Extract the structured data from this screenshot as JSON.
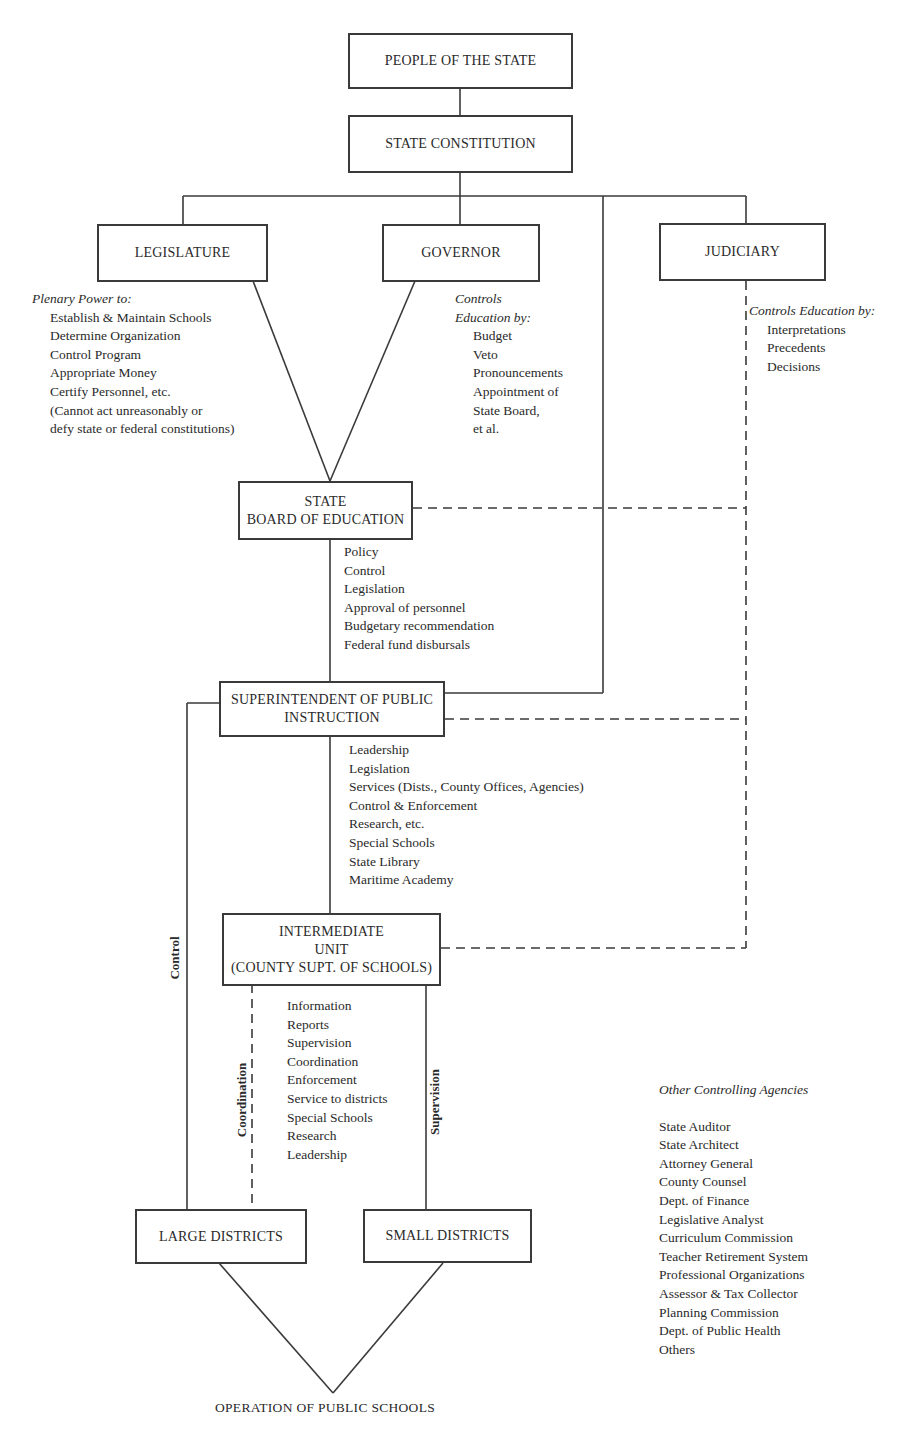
{
  "diagram": {
    "nodes": {
      "people": "PEOPLE OF THE STATE",
      "constitution": "STATE CONSTITUTION",
      "legislature": "LEGISLATURE",
      "governor": "GOVERNOR",
      "judiciary": "JUDICIARY",
      "state_board": [
        "STATE",
        "BOARD OF EDUCATION"
      ],
      "superintendent": [
        "SUPERINTENDENT OF PUBLIC",
        "INSTRUCTION"
      ],
      "intermediate": [
        "INTERMEDIATE",
        "UNIT",
        "(COUNTY SUPT. OF SCHOOLS)"
      ],
      "large_districts": "LARGE DISTRICTS",
      "small_districts": "SMALL DISTRICTS",
      "operation": "OPERATION OF PUBLIC SCHOOLS"
    },
    "legislature_notes": {
      "heading": "Plenary Power to:",
      "items": [
        "Establish & Maintain Schools",
        "Determine Organization",
        "Control Program",
        "Appropriate Money",
        "Certify Personnel, etc.",
        "(Cannot act unreasonably or",
        "defy state or federal constitutions)"
      ]
    },
    "governor_notes": {
      "heading": [
        "Controls",
        "Education by:"
      ],
      "items": [
        "Budget",
        "Veto",
        "Pronouncements",
        "Appointment of",
        "State Board,",
        "et al."
      ]
    },
    "judiciary_notes": {
      "heading": "Controls Education by:",
      "items": [
        "Interpretations",
        "Precedents",
        "Decisions"
      ]
    },
    "state_board_notes": {
      "items": [
        "Policy",
        "Control",
        "Legislation",
        "Approval of personnel",
        "Budgetary recommendation",
        "Federal fund disbursals"
      ]
    },
    "superintendent_notes": {
      "items": [
        "Leadership",
        "Legislation",
        "Services (Dists., County Offices, Agencies)",
        "Control & Enforcement",
        "Research, etc.",
        "Special Schools",
        "State Library",
        "Maritime Academy"
      ]
    },
    "intermediate_notes": {
      "items": [
        "Information",
        "Reports",
        "Supervision",
        "Coordination",
        "Enforcement",
        "Service to districts",
        "Special Schools",
        "Research",
        "Leadership"
      ]
    },
    "edge_labels": {
      "control": "Control",
      "coordination": "Coordination",
      "supervision": "Supervision"
    },
    "other_agencies": {
      "heading": "Other Controlling Agencies",
      "items": [
        "State Auditor",
        "State Architect",
        "Attorney General",
        "County Counsel",
        "Dept. of Finance",
        "Legislative Analyst",
        "Curriculum Commission",
        "Teacher Retirement System",
        "Professional Organizations",
        "Assessor & Tax Collector",
        "Planning Commission",
        "Dept. of Public Health",
        "Others"
      ]
    },
    "colors": {
      "line": "#3a3a3a",
      "text": "#2a2a2a",
      "background": "#ffffff"
    }
  }
}
